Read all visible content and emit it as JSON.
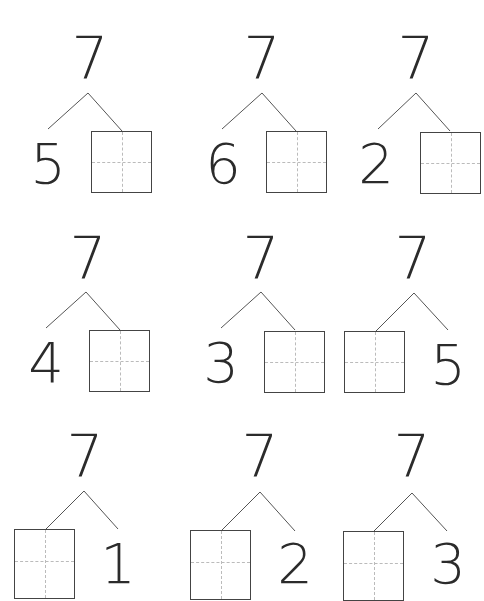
{
  "worksheet": {
    "topic": "number bonds",
    "whole": "7",
    "bonds": [
      {
        "whole": "7",
        "part_known": "5",
        "known_side": "left",
        "unknown_box": "right"
      },
      {
        "whole": "7",
        "part_known": "6",
        "known_side": "left",
        "unknown_box": "right"
      },
      {
        "whole": "7",
        "part_known": "2",
        "known_side": "left",
        "unknown_box": "right"
      },
      {
        "whole": "7",
        "part_known": "4",
        "known_side": "left",
        "unknown_box": "right"
      },
      {
        "whole": "7",
        "part_known": "3",
        "known_side": "left",
        "unknown_box": "right"
      },
      {
        "whole": "7",
        "part_known": "5",
        "known_side": "right",
        "unknown_box": "left"
      },
      {
        "whole": "7",
        "part_known": "1",
        "known_side": "right",
        "unknown_box": "left"
      },
      {
        "whole": "7",
        "part_known": "2",
        "known_side": "right",
        "unknown_box": "left"
      },
      {
        "whole": "7",
        "part_known": "3",
        "known_side": "right",
        "unknown_box": "left"
      }
    ]
  },
  "colors": {
    "ink": "#2b2b2b",
    "box_border": "#444444",
    "guide": "#bbbbbb",
    "background": "#ffffff"
  }
}
